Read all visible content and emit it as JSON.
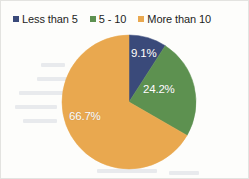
{
  "figure": {
    "background_color": "#fdfdfb",
    "border_color": "#e3e3e0"
  },
  "legend": {
    "position": "top",
    "items": [
      {
        "label": "Less than 5",
        "color": "#3a4a7a",
        "swatch_icon": "square-marker-icon"
      },
      {
        "label": "5 - 10",
        "color": "#5d9150",
        "swatch_icon": "square-marker-icon"
      },
      {
        "label": "More than 10",
        "color": "#e9a84f",
        "swatch_icon": "square-marker-icon"
      }
    ]
  },
  "pie": {
    "center_x": 68,
    "center_y": 68,
    "radius": 67,
    "start_angle_deg": 0,
    "slices": [
      {
        "label": "Less than 5",
        "value": 9.1,
        "display": "9.1%",
        "color": "#3a4a7a"
      },
      {
        "label": "5 - 10",
        "value": 24.2,
        "display": "24.2%",
        "color": "#5d9150"
      },
      {
        "label": "More than 10",
        "value": 66.7,
        "display": "66.7%",
        "color": "#e9a84f"
      }
    ]
  },
  "chart_data": {
    "type": "pie",
    "title": "",
    "xlabel": "",
    "ylabel": "",
    "categories": [
      "Less than 5",
      "5 - 10",
      "More than 10"
    ],
    "values": [
      9.1,
      24.2,
      66.7
    ],
    "value_unit": "percent",
    "data_labels": [
      "9.1%",
      "24.2%",
      "66.7%"
    ],
    "colors": [
      "#3a4a7a",
      "#5d9150",
      "#e9a84f"
    ],
    "legend": {
      "visible": true,
      "position": "top",
      "entries": [
        "Less than 5",
        "5 - 10",
        "More than 10"
      ]
    },
    "start_angle_deg": 0,
    "direction": "clockwise",
    "grid": false,
    "total": 100.0
  }
}
